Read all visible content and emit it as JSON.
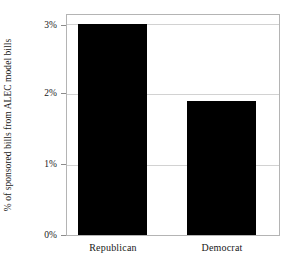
{
  "chart_data": {
    "type": "bar",
    "title": "",
    "subtitle": "",
    "xlabel": "",
    "ylabel": "% of sponsored bills from ALEC model bills",
    "categories": [
      "Republican",
      "Democrat"
    ],
    "values": [
      3.0,
      1.9
    ],
    "value_labels": [
      "3.0%",
      "1.9%"
    ],
    "ylim": [
      0,
      3.13
    ],
    "yticks": [
      0,
      1,
      2,
      3
    ],
    "ytick_labels": [
      "0%",
      "1%",
      "2%",
      "3%"
    ],
    "grid": true,
    "grid_axis": "y",
    "legend": false,
    "legend_position": "none",
    "bar_color": "#000000",
    "background_color": "#ffffff",
    "gridline_color": "#d2d2d2",
    "frame_color": "#b4b4b4"
  },
  "axis": {
    "y_title": "% of sponsored bills from ALEC model bills",
    "tick_0": "0%",
    "tick_1": "1%",
    "tick_2": "2%",
    "tick_3": "3%"
  },
  "bars": [
    {
      "label": "Republican",
      "value": 3.0
    },
    {
      "label": "Democrat",
      "value": 1.9
    }
  ]
}
